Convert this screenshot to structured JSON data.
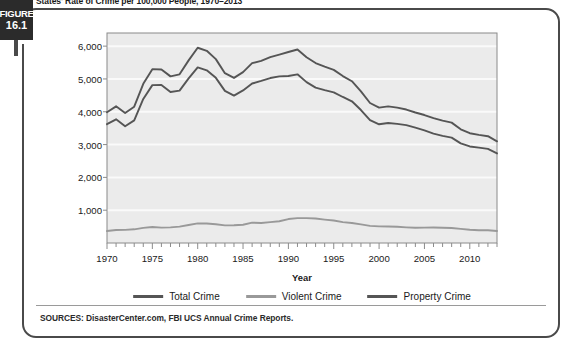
{
  "figure": {
    "badge_word": "FIGURE",
    "badge_number": "16.1",
    "title": "States' Rate of Crime per 100,000 People, 1970–2013"
  },
  "source": {
    "note": "SOURCES: DisasterCenter.com, FBI UCS Annual Crime Reports."
  },
  "colors": {
    "total_crime": "#555555",
    "violent_crime": "#999999",
    "property_crime": "#555555",
    "plot_background": "#ebebeb",
    "gridline": "#fafafa",
    "plot_border": "#8a8a8a",
    "panel_border": "#4a4a4a",
    "badge_background": "#2b2b2b",
    "text": "#1a1a1a"
  },
  "chart_data": {
    "type": "line",
    "title": "States' Rate of Crime per 100,000 People, 1970–2013",
    "xlabel": "Year",
    "ylabel": "",
    "xlim": [
      1970,
      2013
    ],
    "ylim": [
      0,
      6400
    ],
    "ytick_values": [
      1000,
      2000,
      3000,
      4000,
      5000,
      6000
    ],
    "ytick_labels": [
      "1,000",
      "2,000",
      "3,000",
      "4,000",
      "5,000",
      "6,000"
    ],
    "xtick_values": [
      1970,
      1975,
      1980,
      1985,
      1990,
      1995,
      2000,
      2005,
      2010
    ],
    "xtick_labels": [
      "1970",
      "1975",
      "1980",
      "1985",
      "1990",
      "1995",
      "2000",
      "2005",
      "2010"
    ],
    "minor_xticks_every": 1,
    "grid": true,
    "grid_axis": "y",
    "legend_position": "bottom",
    "x": [
      1970,
      1971,
      1972,
      1973,
      1974,
      1975,
      1976,
      1977,
      1978,
      1979,
      1980,
      1981,
      1982,
      1983,
      1984,
      1985,
      1986,
      1987,
      1988,
      1989,
      1990,
      1991,
      1992,
      1993,
      1994,
      1995,
      1996,
      1997,
      1998,
      1999,
      2000,
      2001,
      2002,
      2003,
      2004,
      2005,
      2006,
      2007,
      2008,
      2009,
      2010,
      2011,
      2012,
      2013
    ],
    "series": [
      {
        "name": "Total Crime",
        "color": "#555555",
        "values": [
          3985,
          4165,
          3961,
          4155,
          4850,
          5298,
          5287,
          5078,
          5140,
          5566,
          5950,
          5858,
          5604,
          5175,
          5031,
          5207,
          5480,
          5550,
          5664,
          5741,
          5820,
          5898,
          5660,
          5484,
          5374,
          5275,
          5087,
          4930,
          4620,
          4267,
          4125,
          4163,
          4125,
          4067,
          3977,
          3900,
          3808,
          3730,
          3669,
          3466,
          3346,
          3295,
          3255,
          3099
        ]
      },
      {
        "name": "Violent Crime",
        "color": "#999999",
        "values": [
          364,
          396,
          401,
          417,
          461,
          487,
          468,
          476,
          498,
          549,
          597,
          594,
          571,
          538,
          539,
          557,
          620,
          610,
          637,
          663,
          730,
          758,
          758,
          747,
          714,
          685,
          637,
          611,
          568,
          523,
          506,
          504,
          494,
          476,
          463,
          469,
          474,
          467,
          458,
          431,
          404,
          387,
          387,
          368
        ]
      },
      {
        "name": "Property Crime",
        "color": "#555555",
        "values": [
          3621,
          3769,
          3560,
          3738,
          4389,
          4811,
          4819,
          4602,
          4642,
          5017,
          5353,
          5264,
          5033,
          4637,
          4492,
          4650,
          4860,
          4940,
          5027,
          5078,
          5090,
          5140,
          4902,
          4737,
          4660,
          4590,
          4450,
          4319,
          4052,
          3744,
          3618,
          3658,
          3631,
          3591,
          3514,
          3431,
          3335,
          3263,
          3212,
          3036,
          2942,
          2908,
          2868,
          2731
        ]
      }
    ]
  }
}
